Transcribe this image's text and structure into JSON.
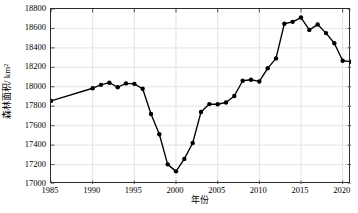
{
  "chart_data": {
    "type": "line",
    "title": "",
    "xlabel": "年份",
    "ylabel": "森林面积/ km²",
    "xlim": [
      1985,
      2021
    ],
    "ylim": [
      17000,
      18800
    ],
    "xticks": [
      1985,
      1990,
      1995,
      2000,
      2005,
      2010,
      2015,
      2020
    ],
    "yticks": [
      17000,
      17200,
      17400,
      17600,
      17800,
      18000,
      18200,
      18400,
      18600,
      18800
    ],
    "grid": true,
    "legend": null,
    "marker": "filled-circle",
    "line_color": "#000000",
    "marker_color": "#000000",
    "x": [
      1985,
      1990,
      1991,
      1992,
      1993,
      1994,
      1995,
      1996,
      1997,
      1998,
      1999,
      2000,
      2001,
      2002,
      2003,
      2004,
      2005,
      2006,
      2007,
      2008,
      2009,
      2010,
      2011,
      2012,
      2013,
      2014,
      2015,
      2016,
      2017,
      2018,
      2019,
      2020,
      2021
    ],
    "values": [
      17855,
      17985,
      18020,
      18042,
      17995,
      18035,
      18030,
      17980,
      17720,
      17512,
      17202,
      17130,
      17258,
      17422,
      17740,
      17822,
      17820,
      17838,
      17905,
      18062,
      18072,
      18055,
      18190,
      18292,
      18648,
      18668,
      18712,
      18585,
      18640,
      18552,
      18448,
      18268,
      18258
    ]
  },
  "axes": {
    "x_tick_labels": [
      "1985",
      "1990",
      "1995",
      "2000",
      "2005",
      "2010",
      "2015",
      "2020"
    ],
    "y_tick_labels": [
      "17000",
      "17200",
      "17400",
      "17600",
      "17800",
      "18000",
      "18200",
      "18400",
      "18600",
      "18800"
    ]
  }
}
